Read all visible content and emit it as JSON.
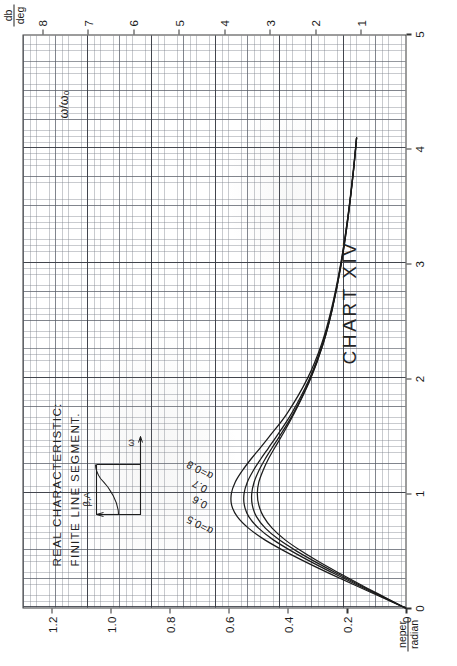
{
  "chart_data": {
    "type": "line",
    "title": "CHART XIV",
    "caption_line1": "REAL CHARACTERISTIC:",
    "caption_line2": "FINITE LINE SEGMENT.",
    "xlabel": "ω/ω₀",
    "ylabel_left_num": "neper",
    "ylabel_left_den": "radian",
    "ylabel_right_num": "db",
    "ylabel_right_den": "deg",
    "xlim": [
      0,
      5
    ],
    "ylim_left": [
      0,
      1.3
    ],
    "ylim_right": [
      0,
      8.45
    ],
    "xticks": [
      "0",
      "1",
      "2",
      "3",
      "4",
      "5"
    ],
    "xtick_values": [
      0,
      1,
      2,
      3,
      4,
      5
    ],
    "yticks_left": [
      "0",
      "0.2",
      "0.4",
      "0.6",
      "0.8",
      "1.0",
      "1.2"
    ],
    "ytick_left_values": [
      0,
      0.2,
      0.4,
      0.6,
      0.8,
      1.0,
      1.2
    ],
    "yticks_right": [
      "1",
      "2",
      "3",
      "4",
      "5",
      "6",
      "7",
      "8"
    ],
    "ytick_right_values": [
      1,
      2,
      3,
      4,
      5,
      6,
      7,
      8
    ],
    "grid": true,
    "grid_style": "graph-paper millimeter ruling",
    "legend_position": "inline curve labels",
    "series": [
      {
        "name": "α=0.5",
        "label": "α=0.5",
        "points": [
          [
            0.0,
            0.0
          ],
          [
            0.1,
            0.075
          ],
          [
            0.2,
            0.15
          ],
          [
            0.3,
            0.222
          ],
          [
            0.4,
            0.292
          ],
          [
            0.5,
            0.356
          ],
          [
            0.6,
            0.412
          ],
          [
            0.7,
            0.455
          ],
          [
            0.8,
            0.484
          ],
          [
            0.9,
            0.5
          ],
          [
            1.0,
            0.505
          ],
          [
            1.1,
            0.5
          ],
          [
            1.2,
            0.486
          ],
          [
            1.3,
            0.468
          ],
          [
            1.4,
            0.446
          ],
          [
            1.5,
            0.423
          ],
          [
            1.7,
            0.38
          ],
          [
            2.0,
            0.325
          ],
          [
            2.3,
            0.283
          ],
          [
            2.6,
            0.252
          ],
          [
            3.0,
            0.221
          ],
          [
            3.4,
            0.198
          ],
          [
            3.8,
            0.18
          ],
          [
            4.1,
            0.169
          ]
        ]
      },
      {
        "name": "α=0.6",
        "label": "0.6",
        "points": [
          [
            0.0,
            0.0
          ],
          [
            0.1,
            0.078
          ],
          [
            0.2,
            0.156
          ],
          [
            0.3,
            0.231
          ],
          [
            0.4,
            0.304
          ],
          [
            0.5,
            0.372
          ],
          [
            0.6,
            0.432
          ],
          [
            0.7,
            0.478
          ],
          [
            0.8,
            0.508
          ],
          [
            0.9,
            0.522
          ],
          [
            1.0,
            0.524
          ],
          [
            1.1,
            0.516
          ],
          [
            1.2,
            0.5
          ],
          [
            1.3,
            0.479
          ],
          [
            1.4,
            0.455
          ],
          [
            1.5,
            0.43
          ],
          [
            1.7,
            0.383
          ],
          [
            2.0,
            0.326
          ],
          [
            2.3,
            0.283
          ],
          [
            2.6,
            0.252
          ],
          [
            3.0,
            0.221
          ],
          [
            3.4,
            0.198
          ],
          [
            3.8,
            0.18
          ],
          [
            4.1,
            0.169
          ]
        ]
      },
      {
        "name": "α=0.7",
        "label": "0.7",
        "points": [
          [
            0.0,
            0.0
          ],
          [
            0.1,
            0.082
          ],
          [
            0.2,
            0.163
          ],
          [
            0.3,
            0.242
          ],
          [
            0.4,
            0.318
          ],
          [
            0.5,
            0.389
          ],
          [
            0.6,
            0.452
          ],
          [
            0.7,
            0.501
          ],
          [
            0.8,
            0.534
          ],
          [
            0.9,
            0.549
          ],
          [
            1.0,
            0.55
          ],
          [
            1.1,
            0.539
          ],
          [
            1.2,
            0.519
          ],
          [
            1.3,
            0.494
          ],
          [
            1.4,
            0.467
          ],
          [
            1.5,
            0.44
          ],
          [
            1.7,
            0.389
          ],
          [
            2.0,
            0.329
          ],
          [
            2.3,
            0.285
          ],
          [
            2.6,
            0.253
          ],
          [
            3.0,
            0.222
          ],
          [
            3.4,
            0.199
          ],
          [
            3.8,
            0.18
          ],
          [
            4.1,
            0.169
          ]
        ]
      },
      {
        "name": "α=0.8",
        "label": "α=0.8",
        "points": [
          [
            0.0,
            0.0
          ],
          [
            0.1,
            0.086
          ],
          [
            0.2,
            0.172
          ],
          [
            0.3,
            0.256
          ],
          [
            0.4,
            0.337
          ],
          [
            0.5,
            0.413
          ],
          [
            0.6,
            0.481
          ],
          [
            0.7,
            0.535
          ],
          [
            0.8,
            0.573
          ],
          [
            0.9,
            0.592
          ],
          [
            1.0,
            0.593
          ],
          [
            1.1,
            0.58
          ],
          [
            1.2,
            0.556
          ],
          [
            1.3,
            0.527
          ],
          [
            1.4,
            0.495
          ],
          [
            1.5,
            0.464
          ],
          [
            1.7,
            0.404
          ],
          [
            2.0,
            0.336
          ],
          [
            2.3,
            0.288
          ],
          [
            2.6,
            0.255
          ],
          [
            3.0,
            0.223
          ],
          [
            3.4,
            0.199
          ],
          [
            3.8,
            0.181
          ],
          [
            4.1,
            0.169
          ]
        ]
      }
    ],
    "annotations": [
      {
        "text": "α=0.5",
        "x": 0.72,
        "y": 0.7
      },
      {
        "text": "0.6",
        "x": 0.92,
        "y": 0.7
      },
      {
        "text": "0.7",
        "x": 1.06,
        "y": 0.7
      },
      {
        "text": "α=0.8",
        "x": 1.2,
        "y": 0.7
      }
    ]
  },
  "inset": {
    "label_alpha": "β,A",
    "label_omega": "ω"
  }
}
